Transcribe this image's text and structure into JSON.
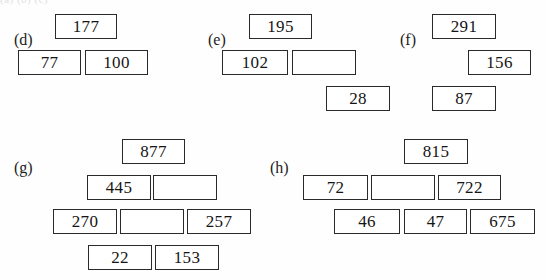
{
  "page": {
    "kind": "math-worksheet",
    "puzzle_type": "addition-pyramid",
    "top_cut_text": "(a)        (b)        (c)"
  },
  "exercises": [
    {
      "id": "d",
      "label": "(d)",
      "label_x": 14,
      "label_y": 32,
      "rows": [
        {
          "cells": [
            {
              "value": "177",
              "blank": false,
              "x": 55,
              "y": 14,
              "w": 62,
              "h": 25
            }
          ]
        },
        {
          "cells": [
            {
              "value": "77",
              "blank": false,
              "x": 18,
              "y": 50,
              "w": 63,
              "h": 25
            },
            {
              "value": "100",
              "blank": false,
              "x": 85,
              "y": 50,
              "w": 63,
              "h": 25
            }
          ]
        }
      ]
    },
    {
      "id": "e",
      "label": "(e)",
      "label_x": 208,
      "label_y": 32,
      "rows": [
        {
          "cells": [
            {
              "value": "195",
              "blank": false,
              "x": 249,
              "y": 14,
              "w": 63,
              "h": 25
            }
          ]
        },
        {
          "cells": [
            {
              "value": "102",
              "blank": false,
              "x": 222,
              "y": 50,
              "w": 66,
              "h": 25
            },
            {
              "value": "",
              "blank": true,
              "x": 292,
              "y": 50,
              "w": 64,
              "h": 25
            }
          ]
        },
        {
          "cells": [
            {
              "value": "28",
              "blank": false,
              "x": 326,
              "y": 86,
              "w": 64,
              "h": 25
            }
          ]
        }
      ]
    },
    {
      "id": "f",
      "label": "(f)",
      "label_x": 400,
      "label_y": 32,
      "rows": [
        {
          "cells": [
            {
              "value": "291",
              "blank": false,
              "x": 432,
              "y": 14,
              "w": 64,
              "h": 25
            }
          ]
        },
        {
          "cells": [
            {
              "value": "156",
              "blank": false,
              "x": 468,
              "y": 50,
              "w": 63,
              "h": 25
            }
          ]
        },
        {
          "cells": [
            {
              "value": "87",
              "blank": false,
              "x": 432,
              "y": 86,
              "w": 64,
              "h": 25
            }
          ]
        }
      ]
    },
    {
      "id": "g",
      "label": "(g)",
      "label_x": 14,
      "label_y": 160,
      "rows": [
        {
          "cells": [
            {
              "value": "877",
              "blank": false,
              "x": 122,
              "y": 139,
              "w": 63,
              "h": 25
            }
          ]
        },
        {
          "cells": [
            {
              "value": "445",
              "blank": false,
              "x": 87,
              "y": 175,
              "w": 64,
              "h": 25
            },
            {
              "value": "",
              "blank": true,
              "x": 153,
              "y": 175,
              "w": 64,
              "h": 25
            }
          ]
        },
        {
          "cells": [
            {
              "value": "270",
              "blank": false,
              "x": 53,
              "y": 209,
              "w": 64,
              "h": 25
            },
            {
              "value": "",
              "blank": true,
              "x": 120,
              "y": 209,
              "w": 64,
              "h": 25
            },
            {
              "value": "257",
              "blank": false,
              "x": 187,
              "y": 209,
              "w": 64,
              "h": 25
            }
          ]
        },
        {
          "cells": [
            {
              "value": "22",
              "blank": false,
              "x": 88,
              "y": 245,
              "w": 64,
              "h": 25
            },
            {
              "value": "153",
              "blank": false,
              "x": 155,
              "y": 245,
              "w": 64,
              "h": 25
            }
          ]
        }
      ]
    },
    {
      "id": "h",
      "label": "(h)",
      "label_x": 270,
      "label_y": 160,
      "rows": [
        {
          "cells": [
            {
              "value": "815",
              "blank": false,
              "x": 404,
              "y": 139,
              "w": 64,
              "h": 25
            }
          ]
        },
        {
          "cells": [
            {
              "value": "72",
              "blank": false,
              "x": 303,
              "y": 175,
              "w": 65,
              "h": 25
            },
            {
              "value": "",
              "blank": true,
              "x": 371,
              "y": 175,
              "w": 64,
              "h": 25
            },
            {
              "value": "722",
              "blank": false,
              "x": 438,
              "y": 175,
              "w": 63,
              "h": 25
            }
          ]
        },
        {
          "cells": [
            {
              "value": "46",
              "blank": false,
              "x": 334,
              "y": 209,
              "w": 66,
              "h": 25
            },
            {
              "value": "47",
              "blank": false,
              "x": 404,
              "y": 209,
              "w": 63,
              "h": 25
            },
            {
              "value": "675",
              "blank": false,
              "x": 470,
              "y": 209,
              "w": 65,
              "h": 25
            }
          ]
        }
      ]
    }
  ]
}
